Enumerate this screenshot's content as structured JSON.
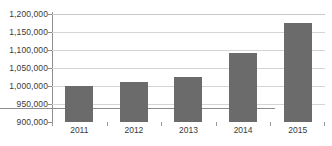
{
  "chart_data": {
    "type": "bar",
    "title": "",
    "subtitle": "",
    "xlabel": "",
    "ylabel": "",
    "categories": [
      "2011",
      "2012",
      "2013",
      "2014",
      "2015"
    ],
    "values": [
      1000000,
      1011000,
      1025000,
      1092000,
      1175000
    ],
    "series": [
      {
        "name": "",
        "values": [
          1000000,
          1011000,
          1025000,
          1092000,
          1175000
        ]
      }
    ],
    "ylim": [
      900000,
      1200000
    ],
    "ytick_step": 50000,
    "ytick_labels": [
      "1,200,000",
      "1,150,000",
      "1,100,000",
      "1,050,000",
      "1,000,000",
      "950,000",
      "900,000"
    ],
    "ytick_values": [
      1200000,
      1150000,
      1100000,
      1050000,
      1000000,
      950000,
      900000
    ],
    "grid": true,
    "grid_axis": "y",
    "legend": false,
    "legend_position": "none",
    "annotations": [],
    "colors": {
      "bar": "#6b6b6b",
      "gridline": "#d4d4d4",
      "axis": "#8d8d8d",
      "text": "#3a3a3a",
      "background": "#ffffff"
    }
  }
}
